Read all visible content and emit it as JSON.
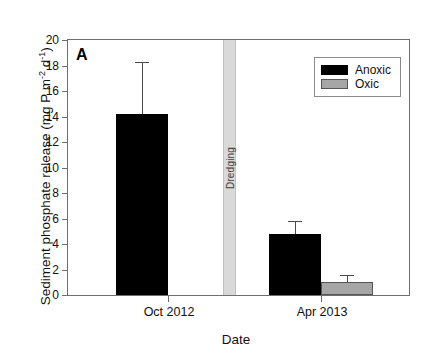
{
  "chart_data": {
    "type": "bar",
    "title": "",
    "panel_label": "A",
    "xlabel": "Date",
    "ylabel": "Sediment phosphate release (mg P m",
    "ylabel_sup1": "-2",
    "ylabel_mid": " d",
    "ylabel_sup2": "-1",
    "ylabel_end": ")",
    "ylabel_full": "Sediment phosphate release (mg P m-2 d-1)",
    "categories": [
      "Oct 2012",
      "Apr 2013"
    ],
    "ylim": [
      0,
      20
    ],
    "ytick_step": 2,
    "yticks": [
      0,
      2,
      4,
      6,
      8,
      10,
      12,
      14,
      16,
      18,
      20
    ],
    "grid": false,
    "legend_position": "upper right",
    "series": [
      {
        "name": "Anoxic",
        "color": "#000000",
        "values": [
          14.2,
          4.8
        ],
        "errors": [
          4.1,
          1.0
        ]
      },
      {
        "name": "Oxic",
        "color": "#a6a6a6",
        "values": [
          null,
          1.0
        ],
        "errors": [
          null,
          0.6
        ]
      }
    ],
    "annotations": [
      {
        "name": "dredging-band",
        "text": "Dredging",
        "orientation": "vertical",
        "color": "#d9d9d9"
      }
    ]
  },
  "ytick_labels": [
    "20",
    "18",
    "16",
    "14",
    "12",
    "10",
    "8",
    "6",
    "4",
    "2",
    "0"
  ],
  "legend": {
    "items": [
      {
        "label": "Anoxic",
        "color": "#000000"
      },
      {
        "label": "Oxic",
        "color": "#a6a6a6"
      }
    ]
  }
}
